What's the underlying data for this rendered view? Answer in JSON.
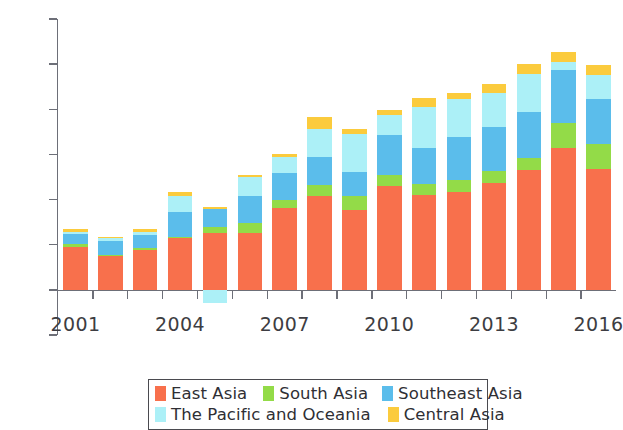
{
  "chart_data": {
    "type": "bar",
    "stacked": true,
    "title": "",
    "subtitle": "",
    "xlabel": "",
    "ylabel": "",
    "grid": false,
    "legend_position": "bottom",
    "ylim": [
      -100,
      600
    ],
    "yticks": [
      -100,
      0,
      100,
      200,
      300,
      400,
      500,
      600
    ],
    "ytick_labels": [
      "-100",
      "0",
      "100",
      "200",
      "300",
      "400",
      "500",
      "600"
    ],
    "categories": [
      2001,
      2002,
      2003,
      2004,
      2005,
      2006,
      2007,
      2008,
      2009,
      2010,
      2011,
      2012,
      2013,
      2014,
      2015,
      2016
    ],
    "xtick_labels": [
      "2001",
      "2004",
      "2007",
      "2010",
      "2013",
      "2016"
    ],
    "xtick_category_index": [
      0,
      3,
      6,
      9,
      12,
      15
    ],
    "series": [
      {
        "name": "East Asia",
        "color": "#F8704C",
        "values": [
          96,
          74,
          88,
          115,
          127,
          127,
          182,
          208,
          176,
          231,
          211,
          216,
          236,
          266,
          315,
          267
        ]
      },
      {
        "name": "South Asia",
        "color": "#93DB48",
        "values": [
          6,
          4,
          5,
          3,
          13,
          21,
          16,
          24,
          32,
          24,
          24,
          27,
          27,
          26,
          55,
          55
        ]
      },
      {
        "name": "Southeast Asia",
        "color": "#5BBDEB",
        "values": [
          22,
          30,
          28,
          54,
          39,
          60,
          61,
          62,
          53,
          88,
          80,
          96,
          98,
          103,
          118,
          100
        ]
      },
      {
        "name": "The Pacific and Oceania",
        "color": "#ACF0F7",
        "values": [
          5,
          6,
          8,
          36,
          -30,
          41,
          35,
          62,
          85,
          45,
          89,
          84,
          74,
          84,
          17,
          53
        ]
      },
      {
        "name": "Central Asia",
        "color": "#FBCB3D",
        "values": [
          5,
          4,
          5,
          8,
          5,
          5,
          6,
          28,
          11,
          11,
          22,
          13,
          20,
          22,
          23,
          22
        ]
      }
    ],
    "totals": [
      134,
      118,
      134,
      216,
      184,
      254,
      300,
      384,
      357,
      399,
      426,
      436,
      455,
      501,
      528,
      497
    ]
  },
  "legend": {
    "row1": [
      {
        "label": "East Asia",
        "color": "#F8704C"
      },
      {
        "label": "South Asia",
        "color": "#93DB48"
      },
      {
        "label": "Southeast Asia",
        "color": "#5BBDEB"
      }
    ],
    "row2": [
      {
        "label": "The Pacific and Oceania",
        "color": "#ACF0F7"
      },
      {
        "label": "Central Asia",
        "color": "#FBCB3D"
      }
    ]
  }
}
